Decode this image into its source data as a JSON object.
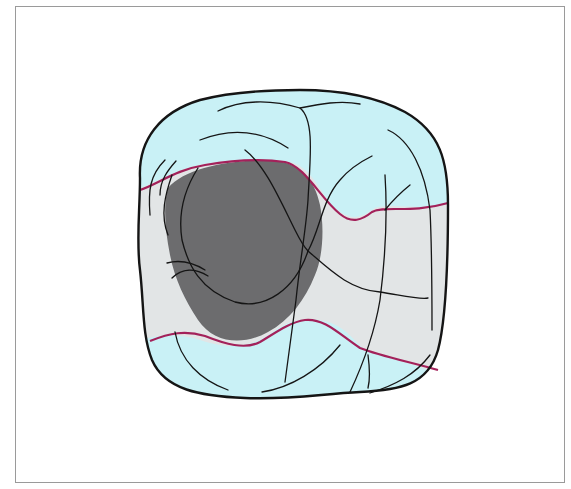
{
  "figure": {
    "frame_color": "#9a9a9a",
    "colors": {
      "tooth_fill": "#c9f1f6",
      "band_fill": "#e2e5e6",
      "lesion_fill": "#6c6c6e",
      "outline": "#151515",
      "margin_line": "#a3215a"
    },
    "regions": [
      {
        "name": "tooth-crown",
        "color": "#c9f1f6"
      },
      {
        "name": "preparation-band",
        "color": "#e2e5e6"
      },
      {
        "name": "lesion-area",
        "color": "#6c6c6e"
      }
    ]
  }
}
